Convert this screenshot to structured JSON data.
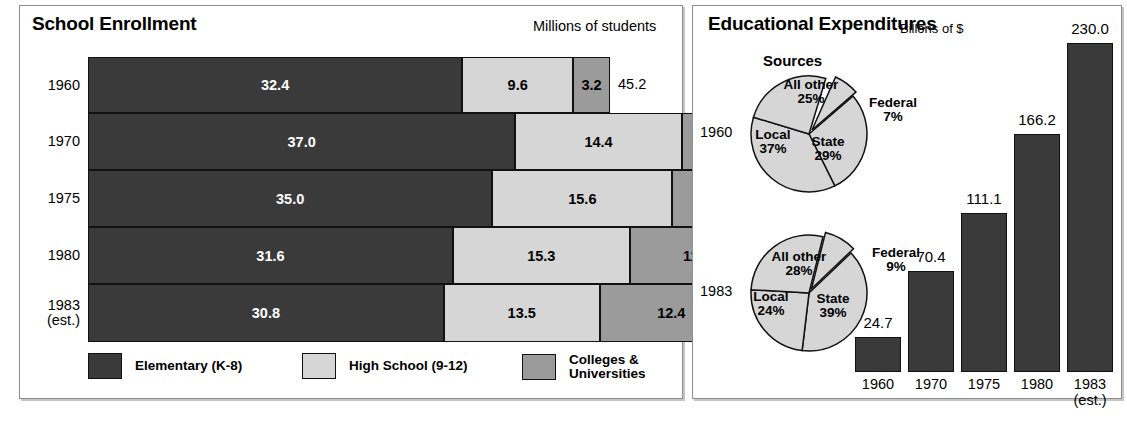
{
  "left_panel": {
    "title": "School Enrollment",
    "units": "Millions of students",
    "legend": [
      {
        "label": "Elementary (K-8)",
        "color": "#3a3a3a",
        "name": "elementary"
      },
      {
        "label": "High School (9-12)",
        "color": "#d6d6d6",
        "name": "high-school"
      },
      {
        "label": "Colleges &\nUniversities",
        "line1": "Colleges &",
        "line2": "Universities",
        "color": "#9b9b9b",
        "name": "colleges"
      }
    ]
  },
  "right_panel": {
    "title": "Educational Expenditures",
    "units": "Billons of $",
    "sources_label": "Sources",
    "pie_year_1960": "1960",
    "pie_year_1983": "1983"
  },
  "chart_data": [
    {
      "type": "bar",
      "orientation": "horizontal",
      "stacked": true,
      "title": "School Enrollment",
      "ylabel": "",
      "xlabel": "Millions of students",
      "categories": [
        "1960",
        "1970",
        "1975",
        "1980",
        "1983 (est.)"
      ],
      "category_lines": [
        [
          "1960"
        ],
        [
          "1970"
        ],
        [
          "1975"
        ],
        [
          "1980"
        ],
        [
          "1983",
          "(est.)"
        ]
      ],
      "series": [
        {
          "name": "Elementary (K-8)",
          "color": "#3a3a3a",
          "values": [
            32.4,
            37.0,
            35.0,
            31.6,
            30.8
          ],
          "labels": [
            "32.4",
            "37.0",
            "35.0",
            "31.6",
            "30.8"
          ]
        },
        {
          "name": "High School (9-12)",
          "color": "#d6d6d6",
          "values": [
            9.6,
            14.4,
            15.6,
            15.3,
            13.5
          ],
          "labels": [
            "9.6",
            "14.4",
            "15.6",
            "15.3",
            "13.5"
          ]
        },
        {
          "name": "Colleges & Universities",
          "color": "#9b9b9b",
          "values": [
            3.2,
            7.1,
            9.0,
            11.6,
            12.4
          ],
          "labels": [
            "3.2",
            "7.1",
            "9.0",
            "11.6",
            "12.4"
          ]
        }
      ],
      "totals": [
        45.2,
        58.6,
        59.7,
        58.5,
        56.7
      ],
      "total_labels": [
        "45.2",
        "58.6",
        "59.7",
        "58.5",
        "56.7"
      ],
      "xlim": [
        0,
        60
      ],
      "grid": false,
      "legend_position": "bottom"
    },
    {
      "type": "pie",
      "title": "Sources",
      "year": "1960",
      "slices": [
        {
          "label": "Federal",
          "pct": 7,
          "pct_label": "7%"
        },
        {
          "label": "State",
          "pct": 29,
          "pct_label": "29%"
        },
        {
          "label": "Local",
          "pct": 37,
          "pct_label": "37%"
        },
        {
          "label": "All other",
          "pct": 25,
          "pct_label": "25%"
        }
      ],
      "fill": "#d6d6d6"
    },
    {
      "type": "pie",
      "title": "Sources",
      "year": "1983",
      "slices": [
        {
          "label": "Federal",
          "pct": 9,
          "pct_label": "9%"
        },
        {
          "label": "State",
          "pct": 39,
          "pct_label": "39%"
        },
        {
          "label": "Local",
          "pct": 24,
          "pct_label": "24%"
        },
        {
          "label": "All other",
          "pct": 28,
          "pct_label": "28%"
        }
      ],
      "fill": "#d6d6d6"
    },
    {
      "type": "bar",
      "orientation": "vertical",
      "title": "Educational Expenditures",
      "ylabel": "Billons of $",
      "xlabel": "",
      "categories": [
        "1960",
        "1970",
        "1975",
        "1980",
        "1983 (est.)"
      ],
      "category_lines": [
        [
          "1960"
        ],
        [
          "1970"
        ],
        [
          "1975"
        ],
        [
          "1980"
        ],
        [
          "1983",
          "(est.)"
        ]
      ],
      "values": [
        24.7,
        70.4,
        111.1,
        166.2,
        230.0
      ],
      "value_labels": [
        "24.7",
        "70.4",
        "111.1",
        "166.2",
        "230.0"
      ],
      "ylim": [
        0,
        230
      ],
      "color": "#3a3a3a",
      "grid": false
    }
  ]
}
